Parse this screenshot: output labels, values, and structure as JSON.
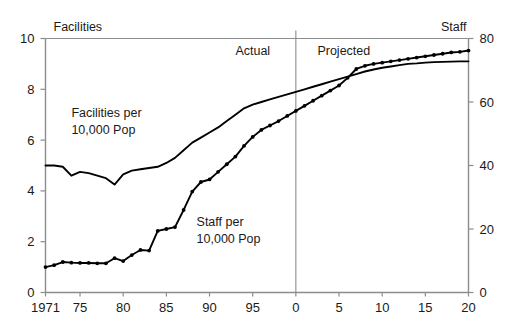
{
  "chart_data": {
    "type": "line",
    "title": "",
    "subtitle": "",
    "xlabel": "",
    "ylabel": "",
    "grid": false,
    "legend_position": "inline-annotations",
    "x_axis": {
      "ticks": [
        1971,
        1975,
        1980,
        1985,
        1990,
        1995,
        2000,
        2005,
        2010,
        2015,
        2020
      ],
      "tick_labels": [
        "1971",
        "75",
        "80",
        "85",
        "90",
        "95",
        "0",
        "5",
        "10",
        "15",
        "20"
      ],
      "xlim": [
        1971,
        2020
      ]
    },
    "left_axis": {
      "label": "Facilities",
      "ticks": [
        0,
        2,
        4,
        6,
        8,
        10
      ],
      "tick_labels": [
        "0",
        "2",
        "4",
        "6",
        "8",
        "10"
      ],
      "ylim": [
        0,
        10
      ]
    },
    "right_axis": {
      "label": "Staff",
      "ticks": [
        0,
        20,
        40,
        60,
        80
      ],
      "tick_labels": [
        "0",
        "20",
        "40",
        "60",
        "80"
      ],
      "ylim": [
        0,
        80
      ]
    },
    "annotations": [
      {
        "name": "actual-label",
        "text": "Actual",
        "x": 1993,
        "y": 9.35
      },
      {
        "name": "projected-label",
        "text": "Projected",
        "x": 2002.5,
        "y": 9.35
      },
      {
        "name": "facilities-series-label",
        "text": "Facilities per",
        "x": 1974,
        "y": 6.9
      },
      {
        "name": "facilities-series-label-2",
        "text": "10,000 Pop",
        "x": 1974,
        "y": 6.25
      },
      {
        "name": "staff-series-label",
        "text": "Staff per",
        "x": 1988.5,
        "y": 2.6
      },
      {
        "name": "staff-series-label-2",
        "text": "10,000 Pop",
        "x": 1988.5,
        "y": 1.95
      }
    ],
    "divider": {
      "name": "actual-projected-divider",
      "x": 2000
    },
    "series": [
      {
        "name": "Facilities per 10,000 Pop",
        "axis": "left",
        "markers": false,
        "x": [
          1971,
          1972,
          1973,
          1974,
          1975,
          1976,
          1977,
          1978,
          1979,
          1980,
          1981,
          1982,
          1983,
          1984,
          1985,
          1986,
          1987,
          1988,
          1989,
          1990,
          1991,
          1992,
          1993,
          1994,
          1995,
          1996,
          1997,
          1998,
          1999,
          2000,
          2001,
          2002,
          2003,
          2004,
          2005,
          2006,
          2007,
          2008,
          2009,
          2010,
          2011,
          2012,
          2013,
          2014,
          2015,
          2016,
          2017,
          2018,
          2019,
          2020
        ],
        "values": [
          5.0,
          5.0,
          4.95,
          4.6,
          4.75,
          4.7,
          4.6,
          4.5,
          4.25,
          4.65,
          4.8,
          4.85,
          4.9,
          4.95,
          5.1,
          5.3,
          5.6,
          5.9,
          6.1,
          6.3,
          6.5,
          6.75,
          7.0,
          7.25,
          7.4,
          7.5,
          7.6,
          7.7,
          7.8,
          7.9,
          8.0,
          8.1,
          8.2,
          8.3,
          8.4,
          8.5,
          8.6,
          8.7,
          8.78,
          8.85,
          8.9,
          8.95,
          9.0,
          9.02,
          9.05,
          9.07,
          9.08,
          9.09,
          9.1,
          9.1
        ]
      },
      {
        "name": "Staff per 10,000 Pop",
        "axis": "right",
        "markers": true,
        "x": [
          1971,
          1972,
          1973,
          1974,
          1975,
          1976,
          1977,
          1978,
          1979,
          1980,
          1981,
          1982,
          1983,
          1984,
          1985,
          1986,
          1987,
          1988,
          1989,
          1990,
          1991,
          1992,
          1993,
          1994,
          1995,
          1996,
          1997,
          1998,
          1999,
          2000,
          2001,
          2002,
          2003,
          2004,
          2005,
          2006,
          2007,
          2008,
          2009,
          2010,
          2011,
          2012,
          2013,
          2014,
          2015,
          2016,
          2017,
          2018,
          2019,
          2020
        ],
        "values": [
          8.0,
          8.6,
          9.6,
          9.4,
          9.3,
          9.3,
          9.2,
          9.2,
          10.8,
          9.9,
          11.8,
          13.4,
          13.2,
          19.4,
          20.0,
          20.6,
          26.0,
          31.8,
          34.8,
          35.6,
          38.0,
          40.4,
          42.8,
          46.2,
          49.0,
          51.2,
          52.6,
          54.0,
          55.6,
          57.2,
          58.8,
          60.4,
          62.0,
          63.6,
          65.2,
          67.6,
          70.4,
          71.4,
          72.0,
          72.4,
          72.8,
          73.2,
          73.6,
          74.0,
          74.4,
          74.8,
          75.2,
          75.6,
          75.8,
          76.2
        ]
      }
    ]
  },
  "colors": {
    "line": "#000000",
    "axis": "#8c8c8c",
    "text": "#1a1a1a",
    "background": "#ffffff"
  }
}
